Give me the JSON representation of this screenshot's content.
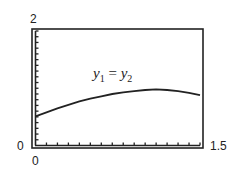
{
  "chart_data": {
    "type": "line",
    "title": "",
    "annotation": {
      "var1": "y",
      "sub1": "1",
      "eq": " = ",
      "var2": "y",
      "sub2": "2"
    },
    "xlabel": "",
    "ylabel": "",
    "xlim": [
      0,
      1.5
    ],
    "ylim": [
      0,
      2
    ],
    "x_tick_step": 0.1,
    "y_tick_step": 0.1,
    "tick_labels": {
      "ymax": "2",
      "ymin": "0",
      "xmin": "0",
      "xmax": "1.5"
    },
    "grid": false,
    "series": [
      {
        "name": "y1 = y2",
        "x": [
          0,
          0.1,
          0.2,
          0.3,
          0.4,
          0.5,
          0.6,
          0.7,
          0.8,
          0.9,
          1.0,
          1.1,
          1.2,
          1.3,
          1.4,
          1.5
        ],
        "y": [
          0.51,
          0.58,
          0.65,
          0.71,
          0.77,
          0.82,
          0.86,
          0.9,
          0.93,
          0.95,
          0.97,
          0.98,
          0.97,
          0.95,
          0.92,
          0.88
        ]
      }
    ]
  }
}
